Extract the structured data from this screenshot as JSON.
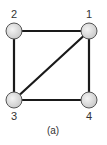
{
  "diagram": {
    "type": "graph",
    "nodes": [
      {
        "id": "1",
        "label": "1",
        "x": 89,
        "y": 31
      },
      {
        "id": "2",
        "label": "2",
        "x": 14,
        "y": 31
      },
      {
        "id": "3",
        "label": "3",
        "x": 14,
        "y": 100
      },
      {
        "id": "4",
        "label": "4",
        "x": 89,
        "y": 100
      }
    ],
    "edges": [
      {
        "from": "2",
        "to": "1"
      },
      {
        "from": "2",
        "to": "3"
      },
      {
        "from": "1",
        "to": "3"
      },
      {
        "from": "1",
        "to": "4"
      },
      {
        "from": "3",
        "to": "4"
      }
    ],
    "caption": "(a)",
    "colors": {
      "edge": "#1a1a1a",
      "node_fill": "#dcdcdc",
      "node_stroke": "#555555",
      "text": "#333333"
    }
  }
}
